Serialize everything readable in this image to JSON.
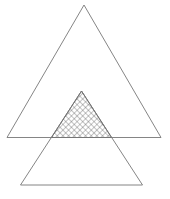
{
  "diagram": {
    "stroke_color": "#777777",
    "hatch_color": "#555555",
    "background": "#ffffff",
    "upper_triangle": {
      "points": [
        [
          84,
          5
        ],
        [
          7,
          137.5
        ],
        [
          161,
          137.5
        ]
      ]
    },
    "lower_triangle": {
      "points": [
        [
          81.5,
          91
        ],
        [
          20.5,
          185
        ],
        [
          142.5,
          185
        ]
      ]
    },
    "intersection": {
      "points": [
        [
          81.5,
          91
        ],
        [
          51.5,
          137.5
        ],
        [
          111.5,
          137.5
        ]
      ],
      "fill": "cross-hatch"
    }
  }
}
